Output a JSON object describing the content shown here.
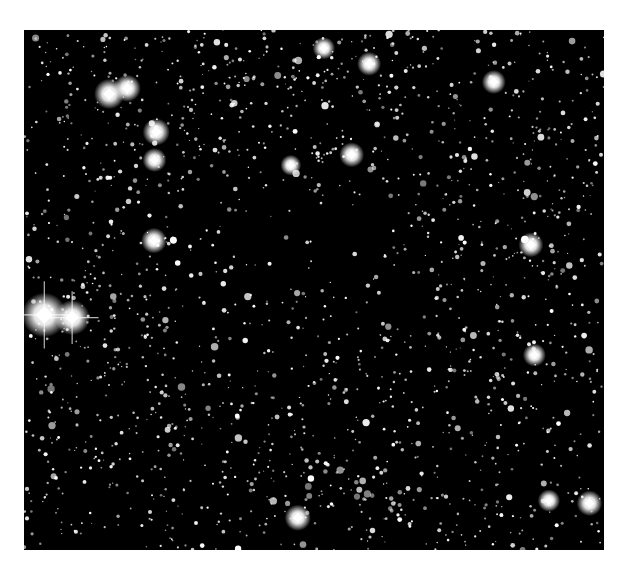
{
  "image": {
    "subject": "starfield-dark-nebula",
    "description": "Black-and-white astronomical starfield with a sparse dark region near the center",
    "background_color": "#000000",
    "star_color": "#ffffff"
  },
  "stars": {
    "bright": [
      {
        "name": "brightest-star-left",
        "fx": 0.035,
        "fy": 0.548,
        "mag": 1.0
      },
      {
        "name": "companion-star-left",
        "fx": 0.083,
        "fy": 0.553,
        "mag": 0.7
      },
      {
        "name": "bright-star-1",
        "fx": 0.147,
        "fy": 0.123,
        "mag": 0.55
      },
      {
        "name": "bright-star-2",
        "fx": 0.178,
        "fy": 0.112,
        "mag": 0.45
      },
      {
        "name": "bright-star-3",
        "fx": 0.228,
        "fy": 0.196,
        "mag": 0.45
      },
      {
        "name": "bright-star-4",
        "fx": 0.225,
        "fy": 0.25,
        "mag": 0.35
      },
      {
        "name": "bright-star-5",
        "fx": 0.224,
        "fy": 0.405,
        "mag": 0.4
      },
      {
        "name": "bright-star-6",
        "fx": 0.565,
        "fy": 0.24,
        "mag": 0.38
      },
      {
        "name": "bright-star-7",
        "fx": 0.46,
        "fy": 0.26,
        "mag": 0.25
      },
      {
        "name": "bright-star-8",
        "fx": 0.874,
        "fy": 0.413,
        "mag": 0.38
      },
      {
        "name": "bright-star-9",
        "fx": 0.88,
        "fy": 0.625,
        "mag": 0.32
      },
      {
        "name": "bright-star-10",
        "fx": 0.472,
        "fy": 0.938,
        "mag": 0.42
      },
      {
        "name": "bright-star-11",
        "fx": 0.975,
        "fy": 0.91,
        "mag": 0.4
      },
      {
        "name": "bright-star-12",
        "fx": 0.81,
        "fy": 0.1,
        "mag": 0.35
      },
      {
        "name": "bright-star-13",
        "fx": 0.595,
        "fy": 0.065,
        "mag": 0.35
      },
      {
        "name": "bright-star-14",
        "fx": 0.517,
        "fy": 0.035,
        "mag": 0.3
      },
      {
        "name": "bright-star-15",
        "fx": 0.905,
        "fy": 0.905,
        "mag": 0.3
      }
    ],
    "faint_count": 1800,
    "dark_region_center": [
      0.48,
      0.45
    ],
    "dark_region_radius": 0.3
  }
}
